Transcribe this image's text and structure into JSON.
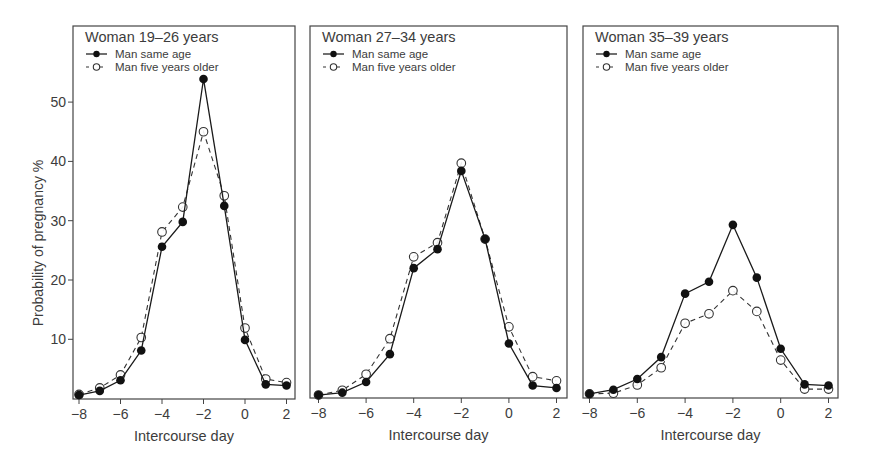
{
  "figure": {
    "ylabel": "Probability of pregnancy %",
    "xlabel": "Intercourse day",
    "legend": {
      "series_1": "Man same age",
      "series_2": "Man five years older"
    }
  },
  "chart_data": [
    {
      "type": "line",
      "title": "Woman 19–26 years",
      "xlabel": "Intercourse day",
      "ylabel": "Probability of pregnancy %",
      "x": [
        -8,
        -7,
        -6,
        -5,
        -4,
        -3,
        -2,
        -1,
        0,
        1,
        2
      ],
      "xticks": [
        -8,
        -6,
        -4,
        -2,
        0,
        2
      ],
      "yticks": [
        10,
        20,
        30,
        40,
        50
      ],
      "ylim": [
        0,
        62
      ],
      "grid": false,
      "legend_position": "top-left",
      "series": [
        {
          "name": "Man same age",
          "style": "solid, filled circle",
          "values": [
            0.6,
            1.3,
            3.1,
            8.1,
            25.6,
            29.8,
            53.9,
            32.5,
            9.9,
            2.4,
            2.2
          ]
        },
        {
          "name": "Man five years older",
          "style": "dashed, open circle",
          "values": [
            0.7,
            1.8,
            4.0,
            10.3,
            28.1,
            32.3,
            45.0,
            34.2,
            11.9,
            3.3,
            2.7
          ]
        }
      ]
    },
    {
      "type": "line",
      "title": "Woman 27–34 years",
      "xlabel": "Intercourse day",
      "x": [
        -8,
        -7,
        -6,
        -5,
        -4,
        -3,
        -2,
        -1,
        0,
        1,
        2
      ],
      "xticks": [
        -8,
        -6,
        -4,
        -2,
        0,
        2
      ],
      "ylim": [
        0,
        62
      ],
      "grid": false,
      "legend_position": "top-left",
      "series": [
        {
          "name": "Man same age",
          "style": "solid, filled circle",
          "values": [
            0.6,
            1.0,
            2.8,
            7.5,
            22.0,
            25.2,
            38.4,
            26.9,
            9.3,
            2.2,
            1.8
          ]
        },
        {
          "name": "Man five years older",
          "style": "dashed, open circle",
          "values": [
            0.6,
            1.4,
            4.1,
            10.1,
            23.9,
            26.3,
            39.7,
            26.9,
            12.1,
            3.7,
            3.0
          ]
        }
      ]
    },
    {
      "type": "line",
      "title": "Woman 35–39 years",
      "xlabel": "Intercourse day",
      "x": [
        -8,
        -7,
        -6,
        -5,
        -4,
        -3,
        -2,
        -1,
        0,
        1,
        2
      ],
      "xticks": [
        -8,
        -6,
        -4,
        -2,
        0,
        2
      ],
      "ylim": [
        0,
        62
      ],
      "grid": false,
      "legend_position": "top-left",
      "series": [
        {
          "name": "Man same age",
          "style": "solid, filled circle",
          "values": [
            0.8,
            1.5,
            3.3,
            7.0,
            17.7,
            19.7,
            29.3,
            20.4,
            8.4,
            2.4,
            2.2
          ]
        },
        {
          "name": "Man five years older",
          "style": "dashed, open circle",
          "values": [
            0.8,
            0.9,
            2.3,
            5.2,
            12.7,
            14.3,
            18.2,
            14.7,
            6.5,
            1.6,
            1.6
          ]
        }
      ]
    }
  ],
  "layout": {
    "panels": [
      {
        "left": 73,
        "right": 295,
        "top": 26,
        "bottom": 399,
        "x_first": 79,
        "x_step": 20.75,
        "show_yaxis": true
      },
      {
        "left": 310,
        "right": 567,
        "top": 26,
        "bottom": 398,
        "x_first": 318.5,
        "x_step": 23.8,
        "show_yaxis": false
      },
      {
        "left": 583,
        "right": 838,
        "top": 26,
        "bottom": 398,
        "x_first": 589.5,
        "x_step": 23.9,
        "show_yaxis": false
      }
    ],
    "y_zero": 398.6,
    "y_per_unit": 5.93
  }
}
